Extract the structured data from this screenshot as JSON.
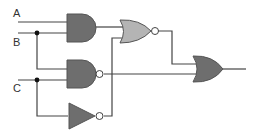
{
  "diagram": {
    "type": "logic-circuit",
    "inputs": [
      {
        "id": "A",
        "label": "A"
      },
      {
        "id": "B",
        "label": "B"
      },
      {
        "id": "C",
        "label": "C"
      }
    ],
    "gates": [
      {
        "id": "g1",
        "type": "AND",
        "inputs": [
          "A",
          "B"
        ],
        "fill": "#6e6e6e"
      },
      {
        "id": "g2",
        "type": "NAND",
        "inputs": [
          "B",
          "C"
        ],
        "fill": "#6e6e6e"
      },
      {
        "id": "g3",
        "type": "NOT",
        "inputs": [
          "C"
        ],
        "fill": "#6e6e6e"
      },
      {
        "id": "g4",
        "type": "NOR",
        "inputs": [
          "g1",
          "g3"
        ],
        "fill": "#b4b4b4"
      },
      {
        "id": "g5",
        "type": "OR",
        "inputs": [
          "g4",
          "g2"
        ],
        "fill": "#6e6e6e"
      }
    ],
    "output": {
      "from": "g5"
    },
    "colors": {
      "wire": "#444444",
      "dark_gate": "#6e6e6e",
      "light_gate": "#b4b4b4",
      "gate_stroke": "#555555",
      "junction": "#111111",
      "background": "#ffffff"
    }
  }
}
